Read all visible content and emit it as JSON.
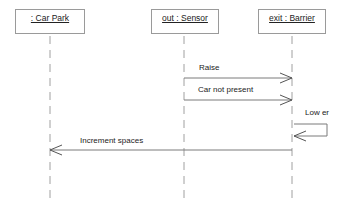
{
  "diagram": {
    "type": "uml-sequence",
    "objects": [
      {
        "id": "car-park",
        "label": ": Car Park"
      },
      {
        "id": "sensor",
        "label": "out : Sensor"
      },
      {
        "id": "barrier",
        "label": "exit : Barrier"
      }
    ],
    "messages": [
      {
        "from": "sensor",
        "to": "barrier",
        "label": "Raise"
      },
      {
        "from": "sensor",
        "to": "barrier",
        "label": "Car not present"
      },
      {
        "from": "barrier",
        "to": "barrier",
        "label": "Low er"
      },
      {
        "from": "barrier",
        "to": "car-park",
        "label": "Increment spaces"
      }
    ],
    "colors": {
      "line": "#8a8a8a",
      "text": "#222222",
      "box_border": "#9a9a9a"
    }
  }
}
